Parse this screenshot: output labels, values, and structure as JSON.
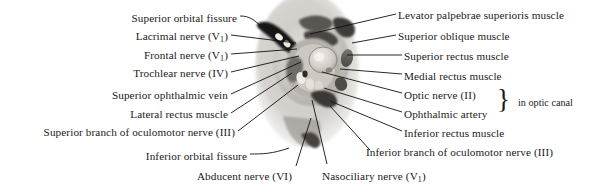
{
  "figure": {
    "image_name": "orbital-apex-photograph"
  },
  "labels_left": [
    {
      "id": "superior-orbital-fissure",
      "text": "Superior orbital fissure",
      "right": 237,
      "top": 12
    },
    {
      "id": "lacrimal-nerve",
      "text": "Lacrimal nerve (V",
      "sub": "1",
      "tail": ")",
      "right": 228,
      "top": 30
    },
    {
      "id": "frontal-nerve",
      "text": "Frontal nerve (V",
      "sub": "1",
      "tail": ")",
      "right": 228,
      "top": 49
    },
    {
      "id": "trochlear-nerve",
      "text": "Trochlear nerve (IV)",
      "right": 228,
      "top": 67
    },
    {
      "id": "superior-ophthalmic-vein",
      "text": "Superior ophthalmic vein",
      "right": 228,
      "top": 89
    },
    {
      "id": "lateral-rectus-muscle",
      "text": "Lateral rectus muscle",
      "right": 228,
      "top": 108
    },
    {
      "id": "superior-branch-oculomotor",
      "text": "Superior branch of oculomotor  nerve (III)",
      "right": 235,
      "top": 126
    },
    {
      "id": "inferior-orbital-fissure",
      "text": "Inferior orbital fissure",
      "right": 247,
      "top": 150
    },
    {
      "id": "abducent-nerve",
      "text": "Abducent nerve (VI)",
      "right": 292,
      "top": 170
    }
  ],
  "labels_right": [
    {
      "id": "levator-palpebrae-superioris-muscle",
      "text": "Levator palpebrae superioris muscle",
      "left": 398,
      "top": 9
    },
    {
      "id": "superior-oblique-muscle",
      "text": "Superior oblique muscle",
      "left": 398,
      "top": 30
    },
    {
      "id": "superior-rectus-muscle",
      "text": "Superior rectus muscle",
      "left": 404,
      "top": 50
    },
    {
      "id": "medial-rectus-muscle",
      "text": "Medial rectus muscle",
      "left": 404,
      "top": 70
    },
    {
      "id": "optic-nerve",
      "text": "Optic nerve (II)",
      "left": 404,
      "top": 89
    },
    {
      "id": "ophthalmic-artery",
      "text": "Ophthalmic artery",
      "left": 404,
      "top": 108
    },
    {
      "id": "inferior-rectus-muscle",
      "text": "Inferior rectus muscle",
      "left": 404,
      "top": 127
    },
    {
      "id": "inferior-branch-oculomotor",
      "text": "Inferior branch of oculomotor nerve (III)",
      "left": 366,
      "top": 146
    }
  ],
  "labels_bottom": [
    {
      "id": "nasociliary-nerve",
      "text": "Nasociliary nerve (V",
      "sub": "1",
      "tail": ")",
      "left": 322,
      "top": 170
    }
  ],
  "bracket": {
    "glyph": "}",
    "left": 497,
    "top": 86,
    "note": "in optic canal",
    "note_left": 518,
    "note_top": 97
  },
  "colors": {
    "text": "#1a1a1a",
    "leader": "#111111",
    "photo_bg": "#ffffff",
    "tissue_light": "#d9d6d2",
    "tissue_mid": "#8d8a86",
    "tissue_dark": "#3a3836",
    "tissue_black": "#171615"
  }
}
